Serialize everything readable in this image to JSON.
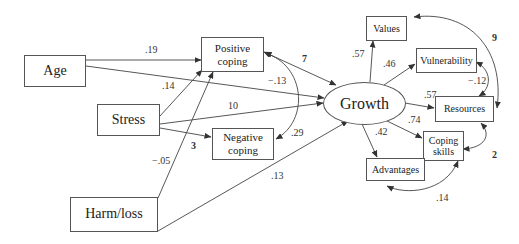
{
  "diagram": {
    "type": "path-diagram",
    "nodes": {
      "age": "Age",
      "stress": "Stress",
      "harm_loss": "Harm/loss",
      "positive_coping": "Positive\ncoping",
      "negative_coping": "Negative\ncoping",
      "growth": "Growth",
      "values": "Values",
      "vulnerability": "Vulnerability",
      "resources": "Resources",
      "coping_skills": "Coping\nskills",
      "advantages": "Advantages"
    },
    "paths": {
      "age_to_positive": ".19",
      "stress_to_positive": ".14",
      "age_to_growth": "−.13",
      "stress_to_growth": "10",
      "stress_to_negative": "3",
      "harm_to_positive": "−.05",
      "harm_to_growth": ".13",
      "positive_growth_cov": "7",
      "positive_negative_cov": ".29",
      "growth_to_values": ".57",
      "growth_to_vulnerability": ".46",
      "growth_to_resources": ".57",
      "growth_to_coping_skills": ".74",
      "growth_to_advantages": ".42",
      "vulnerability_resources_cov": "−.12",
      "values_resources_cov": "9",
      "resources_coping_cov": "2",
      "coping_advantages_cov": ".14"
    }
  }
}
